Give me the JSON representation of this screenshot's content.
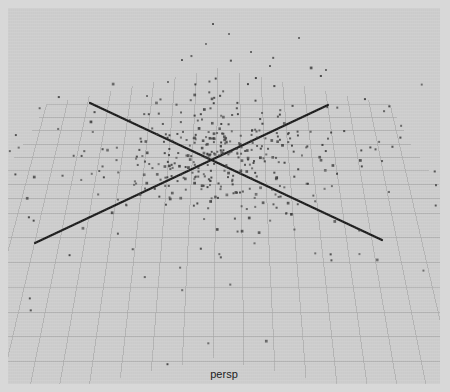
{
  "viewport": {
    "label": "persp",
    "background_color": "#cdcdcd",
    "frame_color": "#d8d8d8"
  },
  "chart_data": {
    "type": "scatter",
    "title": "",
    "subtitle": "",
    "xlabel": "",
    "ylabel": "",
    "annotations": [
      "persp"
    ],
    "legend": [],
    "grid": true,
    "projection": "perspective-3d",
    "grid_spec": {
      "divisions": 16,
      "half_divisions": 8,
      "line_color": "#a8a8a8",
      "line_width": 0.8,
      "origin_px": [
        207,
        152
      ],
      "corner_far_px": [
        210,
        60
      ],
      "corner_near_px": [
        205,
        350
      ],
      "corner_left_px": [
        -40,
        205
      ],
      "corner_right_px": [
        455,
        205
      ]
    },
    "axes": [
      {
        "name": "axis-line-x",
        "color": "#1a1a1a",
        "width": 2.2,
        "from_px": [
          82,
          95
        ],
        "to_px": [
          374,
          232
        ]
      },
      {
        "name": "axis-line-z",
        "color": "#1a1a1a",
        "width": 2.2,
        "from_px": [
          27,
          235
        ],
        "to_px": [
          320,
          97
        ]
      }
    ],
    "points": {
      "count": 420,
      "color": "#3a3a3a",
      "size_px": 2,
      "distribution": "gaussian-cluster-at-origin",
      "cluster_sigma_px": [
        62,
        30
      ],
      "vertical_spray_count": 34
    },
    "xlim": [
      -8,
      8
    ],
    "ylim": [
      -8,
      8
    ]
  }
}
